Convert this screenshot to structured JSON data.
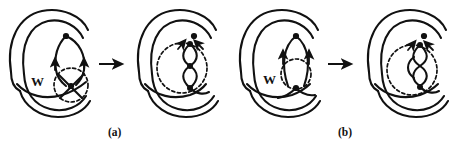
{
  "figure": {
    "type": "knot-diagram-transformation",
    "background_color": "#ffffff",
    "stroke_color": "#111111",
    "width": 459,
    "height": 149,
    "panels": [
      {
        "id": "a",
        "label": "(a)",
        "label_position": {
          "x": 114,
          "y": 134
        },
        "left_diagram": {
          "name": "before-move-a",
          "w_label": "W",
          "w_label_position": {
            "x": 38,
            "y": 82
          },
          "dashed_circle": {
            "cx": 71,
            "cy": 85,
            "r": 17
          },
          "crossing_nodes": 2,
          "arrow_markers": 2,
          "description": "two strands with W-region crossing inside dashed disk"
        },
        "transform_arrow": {
          "name": "transform-arrow-a",
          "glyph": "rightwards-arrow",
          "x1": 97,
          "x2": 124,
          "y": 64
        },
        "right_diagram": {
          "name": "after-move-a",
          "dashed_circle": {
            "cx": 182,
            "cy": 68,
            "r": 25
          },
          "twists": 2,
          "crossing_nodes": 3,
          "description": "double twisted strand inside dashed disk"
        }
      },
      {
        "id": "b",
        "label": "(b)",
        "label_position": {
          "x": 344,
          "y": 134
        },
        "left_diagram": {
          "name": "before-move-b",
          "w_label": "W",
          "w_label_position": {
            "x": 270,
            "y": 80
          },
          "dashed_circle": {
            "cx": 302,
            "cy": 72,
            "r": 15
          },
          "crossing_nodes": 2,
          "arrow_markers": 2,
          "description": "bigon / lens region labelled W inside dashed disk"
        },
        "transform_arrow": {
          "name": "transform-arrow-b",
          "glyph": "rightwards-arrow",
          "x1": 326,
          "x2": 353,
          "y": 64
        },
        "right_diagram": {
          "name": "after-move-b",
          "dashed_circle": {
            "cx": 412,
            "cy": 70,
            "r": 25
          },
          "twists": 3,
          "crossing_nodes": 2,
          "description": "triple twisted strand inside dashed disk"
        }
      }
    ]
  }
}
